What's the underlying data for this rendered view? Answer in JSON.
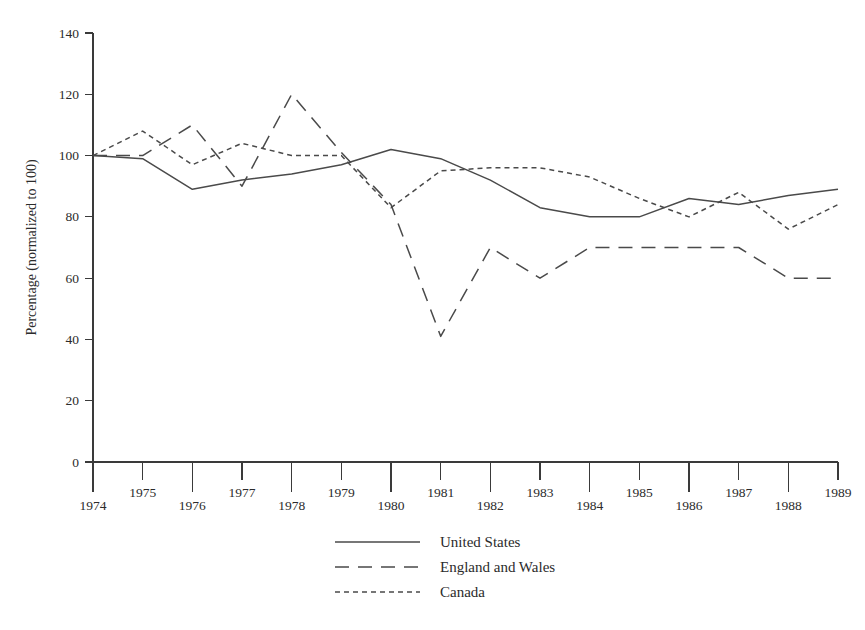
{
  "chart_data": {
    "type": "line",
    "title": "",
    "subtitle": "",
    "xlabel": "",
    "ylabel": "Percentage (normalized to 100)",
    "x": [
      1974,
      1975,
      1976,
      1977,
      1978,
      1979,
      1980,
      1981,
      1982,
      1983,
      1984,
      1985,
      1986,
      1987,
      1988,
      1989
    ],
    "xtick_labels": [
      "1974",
      "1975",
      "1976",
      "1977",
      "1978",
      "1979",
      "1980",
      "1981",
      "1982",
      "1983",
      "1984",
      "1985",
      "1986",
      "1987",
      "1988",
      "1989"
    ],
    "xlim": [
      1974,
      1989
    ],
    "ylim": [
      0,
      140
    ],
    "ytick_labels": [
      "0",
      "20",
      "40",
      "60",
      "80",
      "100",
      "120",
      "140"
    ],
    "yticks": [
      0,
      20,
      40,
      60,
      80,
      100,
      120,
      140
    ],
    "grid": false,
    "legend_position": "bottom-center",
    "series": [
      {
        "name": "United States",
        "style": "solid",
        "color": "#4a4a4a",
        "values": [
          100,
          99,
          89,
          92,
          94,
          97,
          102,
          99,
          92,
          83,
          80,
          80,
          86,
          84,
          87,
          89
        ]
      },
      {
        "name": "England and Wales",
        "style": "long-dash",
        "color": "#4a4a4a",
        "values": [
          100,
          100,
          110,
          90,
          120,
          101,
          84,
          41,
          70,
          60,
          70,
          70,
          70,
          70,
          60,
          60
        ]
      },
      {
        "name": "Canada",
        "style": "short-dash",
        "color": "#4a4a4a",
        "values": [
          100,
          108,
          97,
          104,
          100,
          100,
          83,
          95,
          96,
          96,
          93,
          86,
          80,
          88,
          76,
          84
        ]
      }
    ]
  },
  "legend": {
    "items": [
      {
        "label": "United States",
        "style": "solid"
      },
      {
        "label": "England and Wales",
        "style": "long-dash"
      },
      {
        "label": "Canada",
        "style": "short-dash"
      }
    ]
  }
}
